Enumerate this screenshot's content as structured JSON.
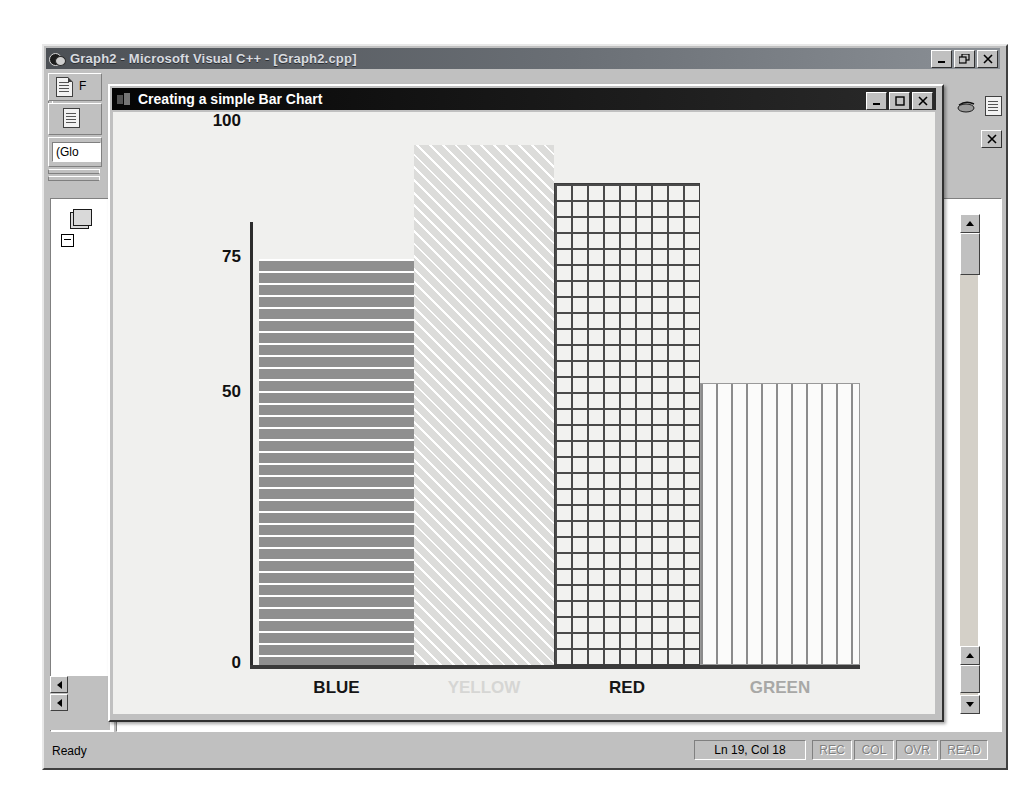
{
  "app_window": {
    "title": "Graph2 - Microsoft Visual C++ - [Graph2.cpp]",
    "icon": "visualcpp-icon",
    "buttons": {
      "minimize": "_",
      "restore": "restore",
      "close": "X"
    },
    "toolbar": {
      "combo_value": "(Glo",
      "icons": [
        "new-document-icon",
        "properties-document-icon",
        "copy-icon"
      ]
    },
    "mdi_close_label": "X"
  },
  "status_bar": {
    "message": "Ready",
    "position": "Ln 19, Col 18",
    "indicators": [
      "REC",
      "COL",
      "OVR",
      "READ"
    ]
  },
  "dialog": {
    "title": "Creating a simple Bar Chart",
    "icon": "bar-chart-icon",
    "buttons": {
      "minimize": "_",
      "maximize": "maximize",
      "close": "X"
    }
  },
  "chart_data": {
    "type": "bar",
    "title": "Car Color Selector",
    "xlabel": "",
    "ylabel": "",
    "categories": [
      "BLUE",
      "YELLOW",
      "RED",
      "GREEN"
    ],
    "values": [
      75,
      96,
      89,
      52
    ],
    "ylim": [
      0,
      110
    ],
    "yticks": [
      0,
      50,
      75,
      100
    ],
    "ytick_labels": [
      "0",
      "50",
      "75",
      "100"
    ],
    "grid": false,
    "legend": false,
    "bar_styles": [
      {
        "label": "BLUE",
        "fill": "horizontal-lines",
        "label_color": "#151515"
      },
      {
        "label": "YELLOW",
        "fill": "diagonal-lines",
        "label_color": "#d6d6d4"
      },
      {
        "label": "RED",
        "fill": "cross-hatch",
        "label_color": "#151515"
      },
      {
        "label": "GREEN",
        "fill": "vertical-lines",
        "label_color": "#a8a8a6"
      }
    ],
    "colors": {
      "canvas": "#f0f0ee",
      "axis": "#2c2c2c",
      "title": "#111111"
    }
  }
}
